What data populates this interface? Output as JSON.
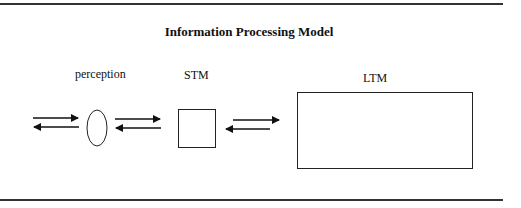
{
  "title": "Information Processing Model",
  "nodes": {
    "perception": {
      "label": "perception",
      "shape": "ellipse"
    },
    "stm": {
      "label": "STM",
      "shape": "square"
    },
    "ltm": {
      "label": "LTM",
      "shape": "rectangle"
    }
  },
  "edges": [
    {
      "from": "input",
      "to": "perception",
      "direction": "bidirectional"
    },
    {
      "from": "perception",
      "to": "stm",
      "direction": "bidirectional"
    },
    {
      "from": "stm",
      "to": "ltm",
      "direction": "bidirectional"
    }
  ]
}
